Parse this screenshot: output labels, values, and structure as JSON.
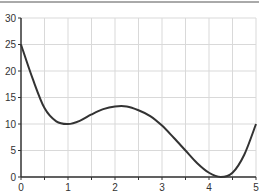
{
  "chart_data": {
    "type": "line",
    "title": "",
    "xlabel": "",
    "ylabel": "",
    "xlim": [
      0,
      5
    ],
    "ylim": [
      0,
      30
    ],
    "grid": true,
    "legend": null,
    "x_ticks": [
      "0",
      "1",
      "2",
      "3",
      "4",
      "5"
    ],
    "y_ticks": [
      "0",
      "5",
      "10",
      "15",
      "20",
      "25",
      "30"
    ],
    "series": [
      {
        "name": "curve",
        "color": "#333333",
        "x": [
          0,
          0.25,
          0.5,
          0.75,
          1.0,
          1.25,
          1.5,
          1.75,
          2.0,
          2.25,
          2.5,
          2.75,
          3.0,
          3.25,
          3.5,
          3.75,
          4.0,
          4.25,
          4.5,
          4.75,
          5.0
        ],
        "values": [
          25,
          18.5,
          13,
          10.5,
          10,
          10.6,
          11.8,
          12.8,
          13.3,
          13.3,
          12.6,
          11.5,
          9.7,
          7.4,
          5,
          2.6,
          0.8,
          0,
          0.8,
          4.2,
          10
        ]
      }
    ]
  }
}
